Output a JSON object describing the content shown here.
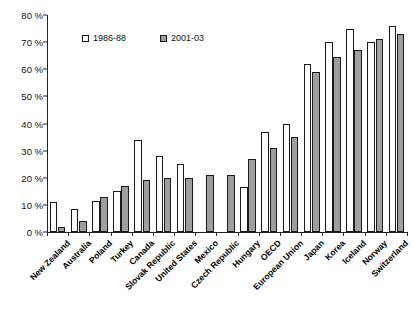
{
  "chart_data": {
    "type": "bar",
    "title": "",
    "xlabel": "",
    "ylabel": "",
    "ylim": [
      0,
      80
    ],
    "ytick_labels": [
      "0 %",
      "10 %",
      "20 %",
      "30 %",
      "40 %",
      "50 %",
      "60 %",
      "70 %",
      "80 %"
    ],
    "ytick_values": [
      0,
      10,
      20,
      30,
      40,
      50,
      60,
      70,
      80
    ],
    "grid": false,
    "legend_position": "top-left-inside",
    "categories": [
      "New Zealand",
      "Australia",
      "Poland",
      "Turkey",
      "Canada",
      "Slovak Republic",
      "United States",
      "Mexico",
      "Czech Republic",
      "Hungary",
      "OECD",
      "European Union",
      "Japan",
      "Korea",
      "Iceland",
      "Norway",
      "Switzerland"
    ],
    "series": [
      {
        "name": "1986-88",
        "color": "#ffffff",
        "values": [
          11,
          8.5,
          11.3,
          15,
          34,
          28,
          25,
          null,
          null,
          16.5,
          37,
          40,
          62,
          70,
          75,
          70,
          76
        ]
      },
      {
        "name": "2001-03",
        "color": "#9e9e9e",
        "values": [
          2,
          4,
          13,
          17,
          19.3,
          20,
          20,
          21,
          21,
          27,
          31,
          35,
          59,
          64.5,
          67,
          71,
          73
        ]
      }
    ]
  },
  "legend": {
    "items": [
      {
        "label": "1986-88",
        "swatch": "white-square-icon"
      },
      {
        "label": "2001-03",
        "swatch": "gray-square-icon"
      }
    ]
  }
}
